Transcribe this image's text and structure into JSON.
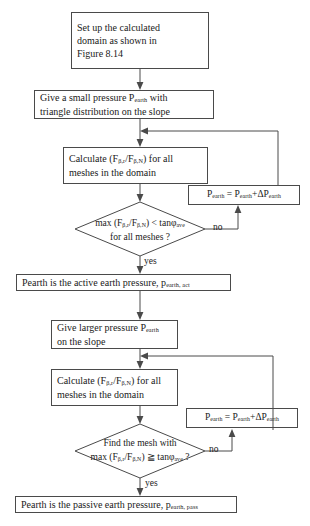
{
  "figure": {
    "type": "flowchart"
  },
  "nodes": {
    "start_box": {
      "shape": "process",
      "line1": "Set  up the calculated",
      "line2": "domain as shown in",
      "line3": "Figure 8.14"
    },
    "small_pressure_box": {
      "shape": "process",
      "line1_a": "Give a small pressure P",
      "line1_sub": "earth",
      "line1_b": " with",
      "line2": "triangle distribution on the slope"
    },
    "calc_box_1": {
      "shape": "process",
      "line1_a": "Calculate (F",
      "line1_sub1": "β,r",
      "line1_b": "/F",
      "line1_sub2": "β,N",
      "line1_c": ") for all",
      "line2": "meshes in the domain"
    },
    "decision_1": {
      "shape": "decision",
      "line1_a": "max (F",
      "line1_sub1": "β,r",
      "line1_b": "/F",
      "line1_sub2": "β,N",
      "line1_c": ") < tanφ",
      "line1_sub3": "ave",
      "line2": "for all meshes ?"
    },
    "increment_box_1": {
      "shape": "process",
      "text_a": "P",
      "sub_a": "earth",
      "text_b": " = P",
      "sub_b": "earth",
      "text_c": "+ΔP",
      "sub_c": "earth"
    },
    "active_result_box": {
      "shape": "process",
      "text_a": "Pearth is the active earth pressure, p",
      "sub_a": "earth, act"
    },
    "larger_pressure_box": {
      "shape": "process",
      "line1_a": "Give larger pressure P",
      "line1_sub": "earth",
      "line2": "on the slope"
    },
    "calc_box_2": {
      "shape": "process",
      "line1_a": "Calculate (F",
      "line1_sub1": "β,r",
      "line1_b": "/F",
      "line1_sub2": "β,N",
      "line1_c": ") for all",
      "line2": "meshes in the domain"
    },
    "decision_2": {
      "shape": "decision",
      "line1": "Find the mesh with",
      "line2_a": "max (F",
      "line2_sub1": "β,r",
      "line2_b": "/F",
      "line2_sub2": "β,N",
      "line2_c": ") ≧ tanφ",
      "line2_sub3": "ave",
      "line2_d": " ?"
    },
    "increment_box_2": {
      "shape": "process",
      "text_a": "P",
      "sub_a": "earth",
      "text_b": " = P",
      "sub_b": "earth",
      "text_c": "+ΔP",
      "sub_c": "earth"
    },
    "passive_result_box": {
      "shape": "process",
      "text_a": "Pearth is the passive earth pressure, p",
      "sub_a": "earth, pass"
    }
  },
  "edge_labels": {
    "no_1": "no",
    "yes_1": "yes",
    "no_2": "no",
    "yes_2": "yes"
  },
  "colors": {
    "stroke": "#4a4a4a",
    "text": "#1a1a1a",
    "background": "#ffffff"
  }
}
